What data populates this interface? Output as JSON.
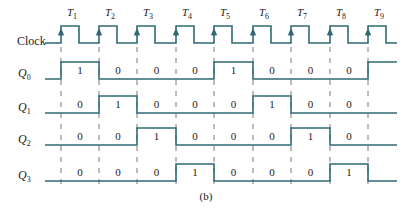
{
  "figure": {
    "caption": "(b)",
    "clock_label": "Clock",
    "line_color": "#2e6b73",
    "dash_color": "#555555"
  },
  "time_labels": [
    "T1",
    "T2",
    "T3",
    "T4",
    "T5",
    "T6",
    "T7",
    "T8",
    "T9"
  ],
  "signals": [
    {
      "name": "Q0",
      "base": "Q",
      "sub": "0",
      "values": [
        "1",
        "0",
        "0",
        "0",
        "1",
        "0",
        "0",
        "0"
      ],
      "end_state": "1"
    },
    {
      "name": "Q1",
      "base": "Q",
      "sub": "1",
      "values": [
        "0",
        "1",
        "0",
        "0",
        "0",
        "1",
        "0",
        "0"
      ],
      "end_state": "0"
    },
    {
      "name": "Q2",
      "base": "Q",
      "sub": "2",
      "values": [
        "0",
        "0",
        "1",
        "0",
        "0",
        "0",
        "1",
        "0"
      ],
      "end_state": "0"
    },
    {
      "name": "Q3",
      "base": "Q",
      "sub": "3",
      "values": [
        "0",
        "0",
        "0",
        "1",
        "0",
        "0",
        "0",
        "1"
      ],
      "end_state": "0"
    }
  ],
  "chart_data": {
    "type": "timing",
    "title": "",
    "caption": "(b)",
    "clock": {
      "label": "Clock",
      "periods": 9,
      "rising_edges": [
        "T1",
        "T2",
        "T3",
        "T4",
        "T5",
        "T6",
        "T7",
        "T8",
        "T9"
      ]
    },
    "intervals": [
      "T1-T2",
      "T2-T3",
      "T3-T4",
      "T4-T5",
      "T5-T6",
      "T6-T7",
      "T7-T8",
      "T8-T9"
    ],
    "series": [
      {
        "name": "Q0",
        "values": [
          1,
          0,
          0,
          0,
          1,
          0,
          0,
          0
        ]
      },
      {
        "name": "Q1",
        "values": [
          0,
          1,
          0,
          0,
          0,
          1,
          0,
          0
        ]
      },
      {
        "name": "Q2",
        "values": [
          0,
          0,
          1,
          0,
          0,
          0,
          1,
          0
        ]
      },
      {
        "name": "Q3",
        "values": [
          0,
          0,
          0,
          1,
          0,
          0,
          0,
          1
        ]
      }
    ]
  }
}
